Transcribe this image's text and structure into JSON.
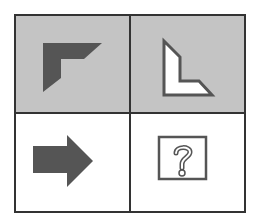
{
  "puzzle": {
    "type": "2x2 analogy matrix",
    "cells": [
      {
        "position": "top-left",
        "shape": "L-corner shape pointing up-left",
        "fill": "dark-gray",
        "background": "gray"
      },
      {
        "position": "top-right",
        "shape": "L-shape rotated, outline only",
        "fill": "white",
        "background": "gray"
      },
      {
        "position": "bottom-left",
        "shape": "right-pointing arrow",
        "fill": "dark-gray",
        "background": "white"
      },
      {
        "position": "bottom-right",
        "shape": "question-mark box",
        "fill": "none",
        "background": "white",
        "label": "?"
      }
    ]
  },
  "colors": {
    "grid_line": "#333333",
    "gray_background": "#c4c4c4",
    "white_background": "#ffffff",
    "dark_fill": "#555555",
    "outline": "#555555"
  }
}
